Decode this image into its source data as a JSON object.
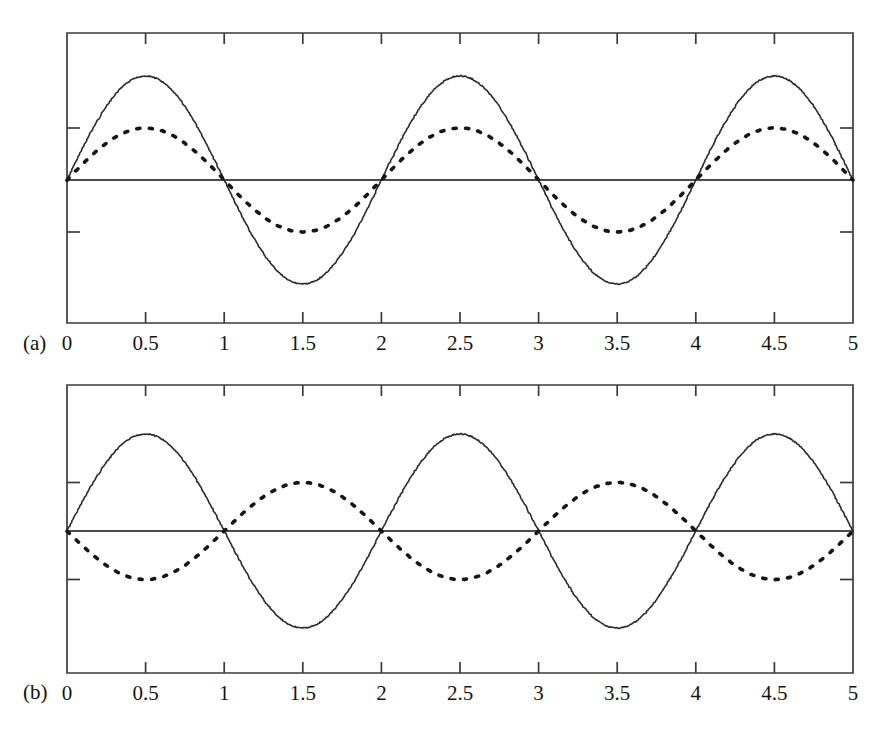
{
  "figure": {
    "background_color": "#ffffff",
    "ink_color": "#2b2b2b",
    "panel_a_letter": "(a)",
    "panel_b_letter": "(b)"
  },
  "chart_data": [
    {
      "type": "line",
      "panel": "(a)",
      "title": "",
      "subtitle": "",
      "xlabel": "",
      "ylabel": "",
      "xlim": [
        0,
        5
      ],
      "ylim": [
        -1.15,
        1.15
      ],
      "grid": false,
      "legend": "none",
      "xticks": [
        0,
        0.5,
        1,
        1.5,
        2,
        2.5,
        3,
        3.5,
        4,
        4.5,
        5
      ],
      "xticklabels": [
        "0",
        "0.5",
        "1",
        "1.5",
        "2",
        "2.5",
        "3",
        "3.5",
        "4",
        "4.5",
        "5"
      ],
      "yticks": [
        -0.5,
        0,
        0.5
      ],
      "yticklabels": [
        "",
        "",
        ""
      ],
      "annotations": [
        "zero baseline drawn across plot at y = 0"
      ],
      "series": [
        {
          "name": "solid-wave",
          "style": "solid",
          "amplitude": 1.0,
          "period": 2.0,
          "phase_deg": 0,
          "expression": "sin(pi*x)",
          "x": [
            0,
            0.25,
            0.5,
            0.75,
            1,
            1.25,
            1.5,
            1.75,
            2,
            2.25,
            2.5,
            2.75,
            3,
            3.25,
            3.5,
            3.75,
            4,
            4.25,
            4.5,
            4.75,
            5
          ],
          "values": [
            0,
            0.707,
            1,
            0.707,
            0,
            -0.707,
            -1,
            -0.707,
            0,
            0.707,
            1,
            0.707,
            0,
            -0.707,
            -1,
            -0.707,
            0,
            0.707,
            1,
            0.707,
            0
          ]
        },
        {
          "name": "dotted-wave",
          "style": "dotted",
          "amplitude": 0.5,
          "period": 2.0,
          "phase_deg": 0,
          "expression": "0.5*sin(pi*x)",
          "x": [
            0,
            0.25,
            0.5,
            0.75,
            1,
            1.25,
            1.5,
            1.75,
            2,
            2.25,
            2.5,
            2.75,
            3,
            3.25,
            3.5,
            3.75,
            4,
            4.25,
            4.5,
            4.75,
            5
          ],
          "values": [
            0,
            0.354,
            0.5,
            0.354,
            0,
            -0.354,
            -0.5,
            -0.354,
            0,
            0.354,
            0.5,
            0.354,
            0,
            -0.354,
            -0.5,
            -0.354,
            0,
            0.354,
            0.5,
            0.354,
            0
          ]
        }
      ]
    },
    {
      "type": "line",
      "panel": "(b)",
      "title": "",
      "subtitle": "",
      "xlabel": "",
      "ylabel": "",
      "xlim": [
        0,
        5
      ],
      "ylim": [
        -1.15,
        1.15
      ],
      "grid": false,
      "legend": "none",
      "xticks": [
        0,
        0.5,
        1,
        1.5,
        2,
        2.5,
        3,
        3.5,
        4,
        4.5,
        5
      ],
      "xticklabels": [
        "0",
        "0.5",
        "1",
        "1.5",
        "2",
        "2.5",
        "3",
        "3.5",
        "4",
        "4.5",
        "5"
      ],
      "yticks": [
        -0.5,
        0,
        0.5
      ],
      "yticklabels": [
        "",
        "",
        ""
      ],
      "annotations": [
        "zero baseline drawn across plot at y = 0",
        "dotted wave is 180 degrees out of phase with solid wave"
      ],
      "series": [
        {
          "name": "solid-wave",
          "style": "solid",
          "amplitude": 1.0,
          "period": 2.0,
          "phase_deg": 0,
          "expression": "sin(pi*x)",
          "x": [
            0,
            0.25,
            0.5,
            0.75,
            1,
            1.25,
            1.5,
            1.75,
            2,
            2.25,
            2.5,
            2.75,
            3,
            3.25,
            3.5,
            3.75,
            4,
            4.25,
            4.5,
            4.75,
            5
          ],
          "values": [
            0,
            0.707,
            1,
            0.707,
            0,
            -0.707,
            -1,
            -0.707,
            0,
            0.707,
            1,
            0.707,
            0,
            -0.707,
            -1,
            -0.707,
            0,
            0.707,
            1,
            0.707,
            0
          ]
        },
        {
          "name": "dotted-wave",
          "style": "dotted",
          "amplitude": 0.5,
          "period": 2.0,
          "phase_deg": 180,
          "expression": "-0.5*sin(pi*x)",
          "x": [
            0,
            0.25,
            0.5,
            0.75,
            1,
            1.25,
            1.5,
            1.75,
            2,
            2.25,
            2.5,
            2.75,
            3,
            3.25,
            3.5,
            3.75,
            4,
            4.25,
            4.5,
            4.75,
            5
          ],
          "values": [
            0,
            -0.354,
            -0.5,
            -0.354,
            0,
            0.354,
            0.5,
            0.354,
            0,
            -0.354,
            -0.5,
            -0.354,
            0,
            0.354,
            0.5,
            0.354,
            0,
            -0.354,
            -0.5,
            -0.354,
            0
          ]
        }
      ]
    }
  ]
}
